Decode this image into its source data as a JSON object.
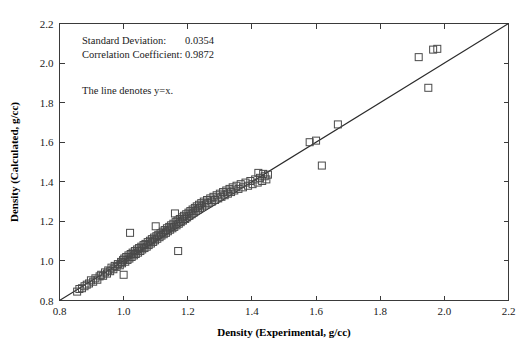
{
  "chart_data": {
    "type": "scatter",
    "title": "",
    "xlabel": "Density (Experimental, g/cc)",
    "ylabel": "Density (Calculated, g/cc)",
    "xlim": [
      0.8,
      2.2
    ],
    "ylim": [
      0.8,
      2.2
    ],
    "xticks": [
      "0.8",
      "1.0",
      "1.2",
      "1.4",
      "1.6",
      "1.8",
      "2.0",
      "2.2"
    ],
    "yticks": [
      "0.8",
      "1.0",
      "1.2",
      "1.4",
      "1.6",
      "1.8",
      "2.0",
      "2.2"
    ],
    "xtick_values": [
      0.8,
      1.0,
      1.2,
      1.4,
      1.6,
      1.8,
      2.0,
      2.2
    ],
    "ytick_values": [
      0.8,
      1.0,
      1.2,
      1.4,
      1.6,
      1.8,
      2.0,
      2.2
    ],
    "grid": false,
    "legend": "none",
    "marker": "open-square",
    "marker_size_px": 7,
    "marker_color": "#4a4a4a",
    "line_color": "#2b2b2b",
    "reference_line": {
      "label": "y=x",
      "from": [
        0.8,
        0.8
      ],
      "to": [
        2.2,
        2.2
      ]
    },
    "points": [
      [
        0.855,
        0.845
      ],
      [
        0.862,
        0.858
      ],
      [
        0.87,
        0.862
      ],
      [
        0.878,
        0.872
      ],
      [
        0.885,
        0.88
      ],
      [
        0.892,
        0.886
      ],
      [
        0.898,
        0.902
      ],
      [
        0.905,
        0.895
      ],
      [
        0.912,
        0.912
      ],
      [
        0.918,
        0.905
      ],
      [
        0.925,
        0.922
      ],
      [
        0.93,
        0.93
      ],
      [
        0.936,
        0.925
      ],
      [
        0.942,
        0.942
      ],
      [
        0.948,
        0.936
      ],
      [
        0.952,
        0.952
      ],
      [
        0.958,
        0.948
      ],
      [
        0.962,
        0.966
      ],
      [
        0.968,
        0.958
      ],
      [
        0.972,
        0.975
      ],
      [
        0.978,
        0.97
      ],
      [
        0.982,
        0.984
      ],
      [
        0.988,
        0.978
      ],
      [
        0.992,
        0.995
      ],
      [
        0.995,
        0.988
      ],
      [
        0.998,
        1.004
      ],
      [
        1.0,
        0.93
      ],
      [
        1.002,
        1.012
      ],
      [
        1.005,
        0.996
      ],
      [
        1.008,
        1.02
      ],
      [
        1.012,
        1.005
      ],
      [
        1.015,
        1.028
      ],
      [
        1.018,
        1.012
      ],
      [
        1.02,
        1.142
      ],
      [
        1.022,
        1.035
      ],
      [
        1.025,
        1.02
      ],
      [
        1.028,
        1.042
      ],
      [
        1.032,
        1.028
      ],
      [
        1.035,
        1.05
      ],
      [
        1.038,
        1.035
      ],
      [
        1.042,
        1.058
      ],
      [
        1.045,
        1.042
      ],
      [
        1.048,
        1.065
      ],
      [
        1.052,
        1.05
      ],
      [
        1.055,
        1.072
      ],
      [
        1.058,
        1.058
      ],
      [
        1.062,
        1.08
      ],
      [
        1.065,
        1.065
      ],
      [
        1.068,
        1.086
      ],
      [
        1.072,
        1.072
      ],
      [
        1.075,
        1.095
      ],
      [
        1.078,
        1.08
      ],
      [
        1.082,
        1.102
      ],
      [
        1.085,
        1.088
      ],
      [
        1.088,
        1.11
      ],
      [
        1.092,
        1.096
      ],
      [
        1.095,
        1.118
      ],
      [
        1.098,
        1.104
      ],
      [
        1.1,
        1.175
      ],
      [
        1.102,
        1.125
      ],
      [
        1.105,
        1.112
      ],
      [
        1.108,
        1.132
      ],
      [
        1.112,
        1.12
      ],
      [
        1.115,
        1.14
      ],
      [
        1.118,
        1.128
      ],
      [
        1.122,
        1.148
      ],
      [
        1.125,
        1.135
      ],
      [
        1.128,
        1.156
      ],
      [
        1.132,
        1.142
      ],
      [
        1.135,
        1.165
      ],
      [
        1.138,
        1.15
      ],
      [
        1.142,
        1.172
      ],
      [
        1.145,
        1.158
      ],
      [
        1.148,
        1.18
      ],
      [
        1.152,
        1.165
      ],
      [
        1.155,
        1.188
      ],
      [
        1.158,
        1.172
      ],
      [
        1.16,
        1.24
      ],
      [
        1.162,
        1.196
      ],
      [
        1.165,
        1.18
      ],
      [
        1.168,
        1.204
      ],
      [
        1.17,
        1.05
      ],
      [
        1.172,
        1.188
      ],
      [
        1.175,
        1.212
      ],
      [
        1.178,
        1.196
      ],
      [
        1.182,
        1.22
      ],
      [
        1.185,
        1.204
      ],
      [
        1.188,
        1.228
      ],
      [
        1.192,
        1.212
      ],
      [
        1.195,
        1.236
      ],
      [
        1.198,
        1.22
      ],
      [
        1.202,
        1.244
      ],
      [
        1.205,
        1.228
      ],
      [
        1.208,
        1.252
      ],
      [
        1.212,
        1.236
      ],
      [
        1.215,
        1.26
      ],
      [
        1.218,
        1.244
      ],
      [
        1.222,
        1.268
      ],
      [
        1.225,
        1.252
      ],
      [
        1.228,
        1.276
      ],
      [
        1.232,
        1.26
      ],
      [
        1.235,
        1.284
      ],
      [
        1.238,
        1.268
      ],
      [
        1.242,
        1.292
      ],
      [
        1.245,
        1.276
      ],
      [
        1.25,
        1.3
      ],
      [
        1.255,
        1.285
      ],
      [
        1.26,
        1.308
      ],
      [
        1.265,
        1.292
      ],
      [
        1.27,
        1.316
      ],
      [
        1.275,
        1.3
      ],
      [
        1.28,
        1.324
      ],
      [
        1.285,
        1.308
      ],
      [
        1.29,
        1.332
      ],
      [
        1.295,
        1.316
      ],
      [
        1.3,
        1.34
      ],
      [
        1.305,
        1.324
      ],
      [
        1.31,
        1.348
      ],
      [
        1.315,
        1.332
      ],
      [
        1.32,
        1.356
      ],
      [
        1.325,
        1.34
      ],
      [
        1.33,
        1.364
      ],
      [
        1.335,
        1.348
      ],
      [
        1.34,
        1.372
      ],
      [
        1.345,
        1.356
      ],
      [
        1.352,
        1.38
      ],
      [
        1.358,
        1.364
      ],
      [
        1.365,
        1.388
      ],
      [
        1.372,
        1.372
      ],
      [
        1.38,
        1.396
      ],
      [
        1.388,
        1.38
      ],
      [
        1.395,
        1.404
      ],
      [
        1.402,
        1.388
      ],
      [
        1.41,
        1.412
      ],
      [
        1.418,
        1.396
      ],
      [
        1.425,
        1.42
      ],
      [
        1.432,
        1.404
      ],
      [
        1.44,
        1.428
      ],
      [
        1.445,
        1.412
      ],
      [
        1.45,
        1.436
      ],
      [
        1.42,
        1.445
      ],
      [
        1.435,
        1.44
      ],
      [
        1.58,
        1.6
      ],
      [
        1.6,
        1.608
      ],
      [
        1.618,
        1.482
      ],
      [
        1.668,
        1.69
      ],
      [
        1.92,
        2.03
      ],
      [
        1.965,
        2.068
      ],
      [
        1.978,
        2.072
      ],
      [
        1.95,
        1.875
      ]
    ]
  },
  "annotations": {
    "std_dev_label": "Standard Deviation:",
    "std_dev_value": "0.0354",
    "corr_coef_label": "Correlation Coefficient:",
    "corr_coef_value": "0.9872",
    "line_note": "The line denotes y=x."
  }
}
